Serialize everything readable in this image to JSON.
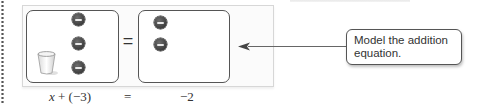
{
  "callout": {
    "text_line1": "Model the addition",
    "text_line2": "equation."
  },
  "mat": {
    "equals": "=",
    "left_side": {
      "items": [
        "cup",
        "negative-counter",
        "negative-counter",
        "negative-counter"
      ],
      "negative_counter_count": 3,
      "cup_count": 1
    },
    "right_side": {
      "items": [
        "negative-counter",
        "negative-counter"
      ],
      "negative_counter_count": 2
    }
  },
  "equation": {
    "left_var": "x",
    "left_rest": " + (−3)",
    "equals": "=",
    "right": "−2"
  },
  "colors": {
    "counter_fill": "#4a4a4a",
    "mat_border": "#555555",
    "frame_bg": "#fbfbfb"
  }
}
